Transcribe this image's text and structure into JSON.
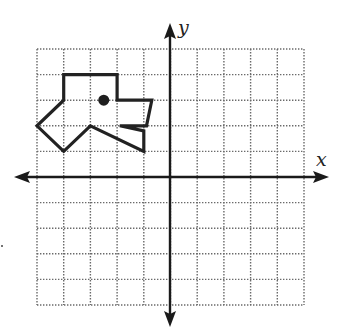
{
  "figure": {
    "type": "coordinate-plane",
    "axes": {
      "x_label": "x",
      "y_label": "y"
    },
    "grid": {
      "x_min": -5,
      "x_max": 5,
      "y_min": -5,
      "y_max": 5,
      "step": 1,
      "style": "dotted"
    },
    "shape": {
      "name": "dog-head-polygon",
      "vertices": [
        [
          -4,
          4
        ],
        [
          -2,
          4
        ],
        [
          -2,
          3
        ],
        [
          -0.7,
          3
        ],
        [
          -0.9,
          2
        ],
        [
          -1.9,
          2
        ],
        [
          -1,
          1.8
        ],
        [
          -1,
          1
        ],
        [
          -3,
          2
        ],
        [
          -4,
          1
        ],
        [
          -5,
          2
        ],
        [
          -4,
          3
        ]
      ],
      "stroke_color": "#222222"
    },
    "point": {
      "name": "eye",
      "x": -2.5,
      "y": 3,
      "color": "#1f1f1f"
    }
  }
}
